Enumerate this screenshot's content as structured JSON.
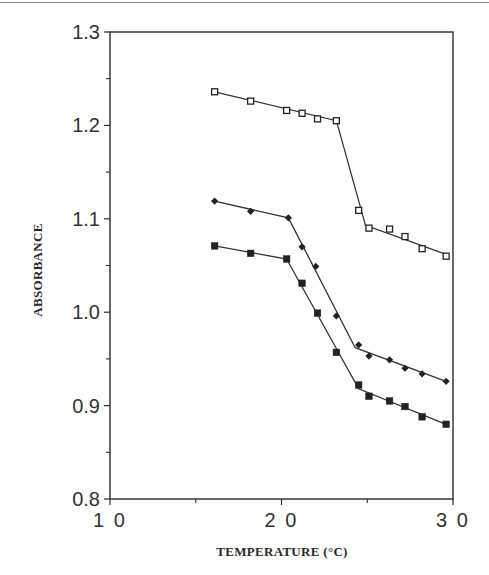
{
  "chart_data": {
    "type": "line",
    "title": "",
    "xlabel": "TEMPERATURE (°C)",
    "ylabel": "ABSORBANCE",
    "xlim": [
      10,
      30
    ],
    "ylim": [
      0.8,
      1.3
    ],
    "x_ticks": [
      10,
      20,
      30
    ],
    "x_tick_labels": [
      "1 0",
      "2 0",
      "3 0"
    ],
    "x_minor_ticks": [
      15,
      25
    ],
    "y_ticks": [
      0.8,
      0.9,
      1.0,
      1.1,
      1.2,
      1.3
    ],
    "y_tick_labels": [
      "0.8",
      "0.9",
      "1.0",
      "1.1",
      "1.2",
      "1.3"
    ],
    "y_minor_ticks": [
      0.85,
      0.95,
      1.05,
      1.15,
      1.25
    ],
    "grid": false,
    "legend": null,
    "series": [
      {
        "name": "open squares",
        "marker": "open-square",
        "points": [
          [
            16.1,
            1.236
          ],
          [
            18.2,
            1.226
          ],
          [
            20.3,
            1.216
          ],
          [
            21.2,
            1.213
          ],
          [
            22.1,
            1.207
          ],
          [
            23.2,
            1.205
          ],
          [
            24.5,
            1.109
          ],
          [
            25.1,
            1.09
          ],
          [
            26.3,
            1.089
          ],
          [
            27.2,
            1.081
          ],
          [
            28.2,
            1.068
          ],
          [
            29.6,
            1.06
          ]
        ],
        "fit_line": [
          [
            16.1,
            1.236
          ],
          [
            23.2,
            1.205
          ],
          [
            24.9,
            1.093
          ],
          [
            29.6,
            1.062
          ]
        ]
      },
      {
        "name": "filled diamonds",
        "marker": "filled-diamond",
        "points": [
          [
            16.1,
            1.119
          ],
          [
            18.2,
            1.108
          ],
          [
            20.4,
            1.101
          ],
          [
            21.2,
            1.07
          ],
          [
            22.0,
            1.049
          ],
          [
            23.2,
            0.996
          ],
          [
            24.5,
            0.965
          ],
          [
            25.1,
            0.953
          ],
          [
            26.3,
            0.949
          ],
          [
            27.2,
            0.94
          ],
          [
            28.2,
            0.934
          ],
          [
            29.6,
            0.926
          ]
        ],
        "fit_line": [
          [
            16.1,
            1.119
          ],
          [
            20.4,
            1.101
          ],
          [
            24.3,
            0.962
          ],
          [
            29.6,
            0.926
          ]
        ]
      },
      {
        "name": "filled squares",
        "marker": "filled-square",
        "points": [
          [
            16.1,
            1.071
          ],
          [
            18.2,
            1.063
          ],
          [
            20.3,
            1.057
          ],
          [
            21.2,
            1.031
          ],
          [
            22.1,
            0.999
          ],
          [
            23.2,
            0.957
          ],
          [
            24.5,
            0.922
          ],
          [
            25.1,
            0.91
          ],
          [
            26.3,
            0.905
          ],
          [
            27.2,
            0.899
          ],
          [
            28.2,
            0.888
          ],
          [
            29.6,
            0.88
          ]
        ],
        "fit_line": [
          [
            16.1,
            1.071
          ],
          [
            20.3,
            1.057
          ],
          [
            24.5,
            0.918
          ],
          [
            29.6,
            0.88
          ]
        ]
      }
    ]
  }
}
